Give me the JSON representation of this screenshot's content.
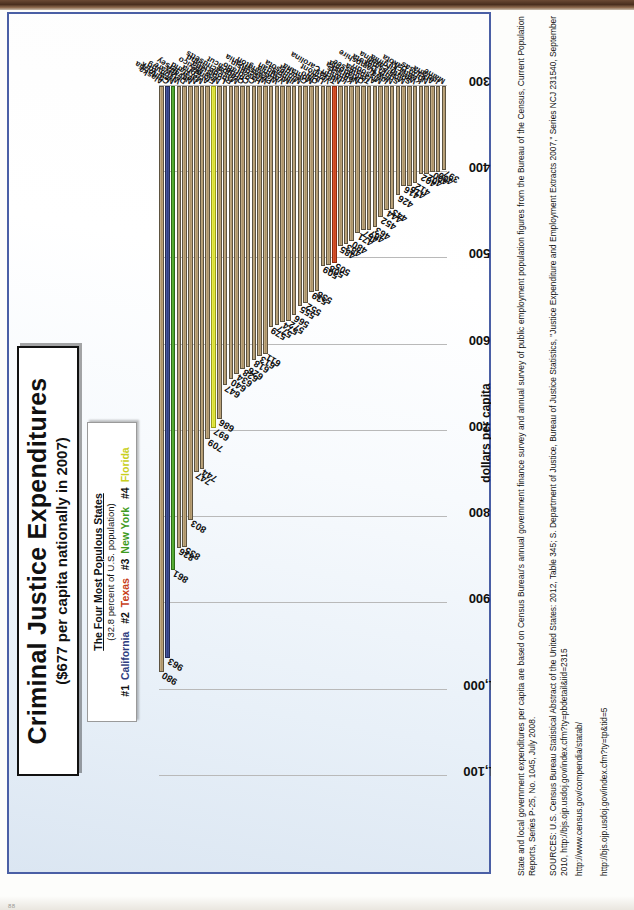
{
  "page": {
    "page_number": "88"
  },
  "title": {
    "main": "Criminal Justice Expenditures",
    "sub": "($677 per capita nationally in 2007)"
  },
  "legend": {
    "heading": "The Four Most Populous States",
    "subheading": "(32.8 percent of U.S. population)",
    "entries": [
      {
        "rank": "#1",
        "state": "California",
        "color": "#2e3c80"
      },
      {
        "rank": "#2",
        "state": "Texas",
        "color": "#c8401a"
      },
      {
        "rank": "#3",
        "state": "New York",
        "color": "#3f9b22"
      },
      {
        "rank": "#4",
        "state": "Florida",
        "color": "#c9cf20"
      }
    ]
  },
  "notes": {
    "paragraph1": "State and local government expenditures per capita are based on Census Bureau's annual government finance survey and annual survey of public employment population figures from the Bureau of the Census, Current Population Reports, Series P-25, No. 1045, July 2008.",
    "paragraph2": "SOURCES: U.S. Census Bureau Statistical Abstract of the United States: 2012, Table 345; S. Department of Justice, Bureau of Justice Statistics, \"Justice Expenditure and Employment Extracts 2007,\" Series NCJ 231540, September 2010, http://bjs.ojp.usdoj.gov/index.cfm?ty=pbdetail&iid=2315",
    "url1": "http://www.census.gov/compendia/statab/",
    "url2": "http://bjs.ojp.usdoj.gov/index.cfm?ty=tp&tid=5"
  },
  "chart_data": {
    "type": "bar",
    "orientation": "horizontal",
    "title": "Criminal Justice Expenditures ($677 per capita nationally in 2007)",
    "xlabel": "",
    "ylabel": "dollars per capita",
    "value_axis_label": "dollars per capita",
    "xlim": [
      300,
      1100
    ],
    "ticks": [
      "1,100",
      "1,000",
      "900",
      "800",
      "700",
      "600",
      "500",
      "400",
      "300"
    ],
    "grid": true,
    "legend_position": "top-center",
    "default_color": "#a98f63",
    "categories": [
      "Alaska",
      "California",
      "New York",
      "Wyoming",
      "Delaware",
      "Nevada",
      "New Jersey",
      "Maryland",
      "Arizona",
      "Florida",
      "New Mexico",
      "Louisiana",
      "Rhode Island",
      "Massachusetts",
      "Oregon",
      "Connecticut",
      "Colorado",
      "Hawaii",
      "Wisconsin",
      "Pennsylvania",
      "Washington",
      "Virginia",
      "Michigan",
      "Illinois",
      "Minnesota",
      "Georgia",
      "Montana",
      "Ohio",
      "Utah",
      "Vermont",
      "Texas",
      "North Carolina",
      "Idaho",
      "Kansas",
      "Nebraska",
      "Oklahoma",
      "Tennessee",
      "Alabama",
      "Missouri",
      "Iowa",
      "New Hampshire",
      "South Dakota",
      "Mississippi",
      "South Carolina",
      "West Virginia",
      "Kentucky",
      "North Dakota",
      "Arkansas",
      "Indiana",
      "Maine"
    ],
    "values": [
      980,
      963,
      861,
      836,
      835,
      803,
      747,
      744,
      709,
      697,
      686,
      647,
      640,
      634,
      628,
      626,
      618,
      613,
      611,
      579,
      577,
      574,
      572,
      566,
      555,
      552,
      539,
      538,
      509,
      508,
      505,
      485,
      483,
      480,
      471,
      467,
      467,
      463,
      452,
      444,
      443,
      426,
      416,
      416,
      412,
      402,
      402,
      400,
      400,
      397
    ],
    "colors": [
      "tan",
      "blue",
      "green",
      "tan",
      "tan",
      "tan",
      "tan",
      "tan",
      "tan",
      "yellow",
      "tan",
      "tan",
      "tan",
      "tan",
      "tan",
      "tan",
      "tan",
      "tan",
      "tan",
      "tan",
      "tan",
      "tan",
      "tan",
      "tan",
      "tan",
      "tan",
      "tan",
      "tan",
      "tan",
      "tan",
      "red",
      "tan",
      "tan",
      "tan",
      "tan",
      "tan",
      "tan",
      "tan",
      "tan",
      "tan",
      "tan",
      "tan",
      "tan",
      "tan",
      "tan",
      "tan",
      "tan",
      "tan",
      "tan",
      "tan"
    ]
  }
}
